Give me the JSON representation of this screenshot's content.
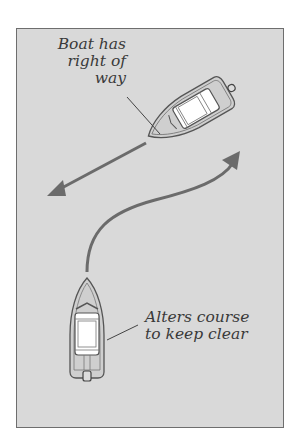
{
  "diagram": {
    "type": "boating right-of-way illustration",
    "background_color": "#d9d9d9",
    "arrow_color": "#6b6b6b",
    "labels": {
      "stand_on": {
        "line1": "Boat has",
        "line2": "right of",
        "line3": "way"
      },
      "give_way": {
        "line1": "Alters course",
        "line2": "to keep clear"
      }
    },
    "elements": [
      {
        "name": "stand-on-boat",
        "heading": "south-west, travelling straight"
      },
      {
        "name": "straight-course-arrow",
        "direction": "toward lower-left"
      },
      {
        "name": "give-way-boat",
        "heading": "north"
      },
      {
        "name": "curved-course-arrow",
        "direction": "curving toward upper-right"
      }
    ]
  }
}
